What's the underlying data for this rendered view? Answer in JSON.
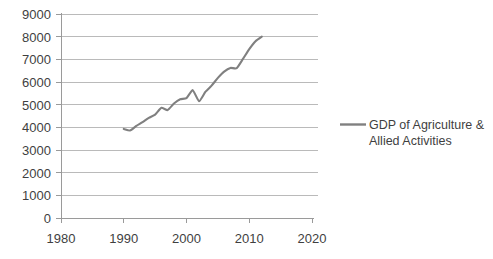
{
  "chart_data": {
    "type": "line",
    "title": "",
    "xlabel": "",
    "ylabel": "",
    "xlim": [
      1980,
      2020
    ],
    "ylim": [
      0,
      9000
    ],
    "grid": true,
    "legend_position": "right",
    "x_tick_labels": [
      "1980",
      "1990",
      "2000",
      "2010",
      "2020"
    ],
    "x_ticks": [
      1980,
      1990,
      2000,
      2010,
      2020
    ],
    "y_tick_labels": [
      "0",
      "1000",
      "2000",
      "3000",
      "4000",
      "5000",
      "6000",
      "7000",
      "8000",
      "9000"
    ],
    "y_ticks": [
      0,
      1000,
      2000,
      3000,
      4000,
      5000,
      6000,
      7000,
      8000,
      9000
    ],
    "series": [
      {
        "name": "GDP of Agriculture & Allied Activities",
        "color": "#808080",
        "x": [
          1990,
          1991,
          1992,
          1993,
          1994,
          1995,
          1996,
          1997,
          1998,
          1999,
          2000,
          2001,
          2002,
          2003,
          2004,
          2005,
          2006,
          2007,
          2008,
          2009,
          2010,
          2011,
          2012
        ],
        "values": [
          3930,
          3860,
          4060,
          4230,
          4420,
          4560,
          4860,
          4760,
          5050,
          5240,
          5290,
          5640,
          5150,
          5560,
          5840,
          6180,
          6460,
          6620,
          6610,
          7020,
          7450,
          7800,
          8000
        ]
      }
    ]
  },
  "legend": {
    "entries": [
      {
        "line1": "GDP of Agriculture &",
        "line2": "Allied Activities",
        "color": "#808080"
      }
    ]
  },
  "colors": {
    "series_line": "#808080",
    "gridline": "#b3b3b3",
    "axis": "#9a9a9a",
    "text": "#3f3f3f",
    "background": "#ffffff"
  }
}
